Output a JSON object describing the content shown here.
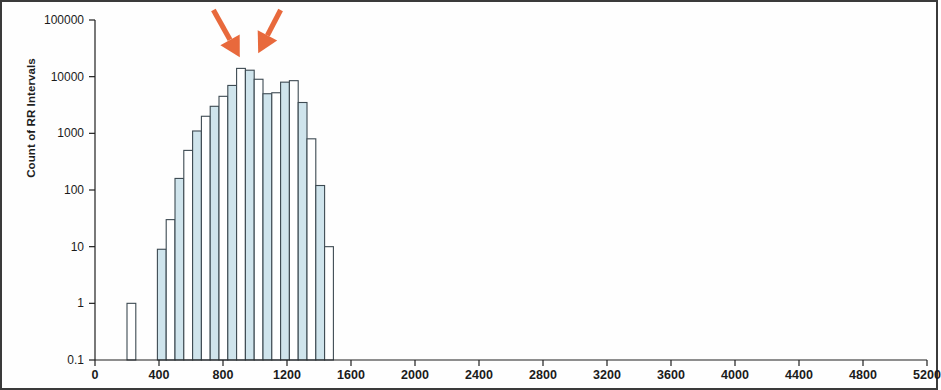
{
  "chart_data": {
    "type": "bar",
    "title": "",
    "subtitle": "",
    "xlabel": "",
    "ylabel": "Count of RR Intervals",
    "yscale": "log",
    "ylim": [
      0.1,
      100000
    ],
    "ytick_labels": [
      "100000",
      "10000",
      "1000",
      "100",
      "10",
      "1",
      "0.1"
    ],
    "ytick_values": [
      100000,
      10000,
      1000,
      100,
      10,
      1,
      0.1
    ],
    "xlim": [
      0,
      5200
    ],
    "xtick_labels": [
      "0",
      "400",
      "800",
      "1200",
      "1600",
      "2000",
      "2400",
      "2800",
      "3200",
      "3600",
      "4000",
      "4400",
      "4800",
      "5200"
    ],
    "xtick_values": [
      0,
      400,
      800,
      1200,
      1600,
      2000,
      2400,
      2800,
      3200,
      3600,
      4000,
      4400,
      4800,
      5200
    ],
    "grid": false,
    "legend": "none",
    "bin_width": 55,
    "bar_fill_alternating": [
      "#ffffff",
      "#cfe4ec"
    ],
    "bar_edge_color": "#3d4a52",
    "bins": [
      {
        "x_left": 200,
        "x_right": 255,
        "value": 1
      },
      {
        "x_left": 390,
        "x_right": 445,
        "value": 9
      },
      {
        "x_left": 445,
        "x_right": 500,
        "value": 30
      },
      {
        "x_left": 500,
        "x_right": 555,
        "value": 160
      },
      {
        "x_left": 555,
        "x_right": 610,
        "value": 500
      },
      {
        "x_left": 610,
        "x_right": 665,
        "value": 1100
      },
      {
        "x_left": 665,
        "x_right": 720,
        "value": 2000
      },
      {
        "x_left": 720,
        "x_right": 775,
        "value": 3000
      },
      {
        "x_left": 775,
        "x_right": 830,
        "value": 4500
      },
      {
        "x_left": 830,
        "x_right": 885,
        "value": 7000
      },
      {
        "x_left": 885,
        "x_right": 940,
        "value": 14000
      },
      {
        "x_left": 940,
        "x_right": 995,
        "value": 13000
      },
      {
        "x_left": 995,
        "x_right": 1050,
        "value": 9000
      },
      {
        "x_left": 1050,
        "x_right": 1105,
        "value": 5000
      },
      {
        "x_left": 1105,
        "x_right": 1160,
        "value": 5200
      },
      {
        "x_left": 1160,
        "x_right": 1215,
        "value": 8000
      },
      {
        "x_left": 1215,
        "x_right": 1270,
        "value": 8500
      },
      {
        "x_left": 1270,
        "x_right": 1325,
        "value": 3500
      },
      {
        "x_left": 1325,
        "x_right": 1380,
        "value": 800
      },
      {
        "x_left": 1380,
        "x_right": 1435,
        "value": 120
      },
      {
        "x_left": 1435,
        "x_right": 1490,
        "value": 10
      }
    ],
    "annotations": [
      {
        "name": "arrow-left",
        "type": "arrow",
        "color": "#e8693c",
        "tail_x": 740,
        "tail_y_label": "top",
        "head_x": 905,
        "head_value": 22000
      },
      {
        "name": "arrow-right",
        "type": "arrow",
        "color": "#e8693c",
        "tail_x": 1160,
        "tail_y_label": "top",
        "head_x": 1020,
        "head_value": 26000
      }
    ]
  },
  "figure": {
    "border_color": "#3a3a3a",
    "background": "#ffffff",
    "axis_color": "#1f1f1f"
  }
}
